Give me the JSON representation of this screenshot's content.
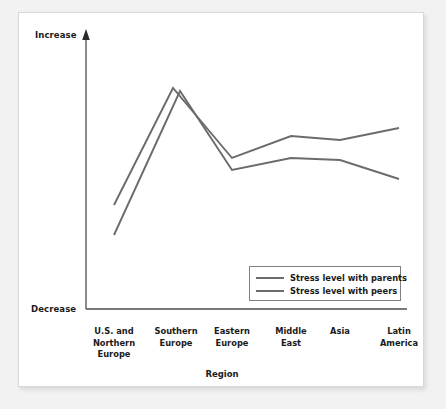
{
  "figure": {
    "background_color": "#f2f2f2",
    "card_color": "#ffffff",
    "line_color": "#6b6b6b",
    "axis_color": "#4d4d4d",
    "text_color": "#1a1a1a"
  },
  "chart_data": {
    "type": "line",
    "title": "",
    "xlabel": "Region",
    "ylabel": "",
    "grid": false,
    "legend_position": "inside-bottom-right",
    "y_axis_top_label": "Increase",
    "y_axis_bottom_label": "Decrease",
    "y_axis_ticks": [],
    "ylim": [
      0,
      100
    ],
    "categories": [
      "U.S. and Northern Europe",
      "Southern Europe",
      "Eastern Europe",
      "Middle East",
      "Asia",
      "Latin America"
    ],
    "category_lines": [
      [
        "U.S. and",
        "Northern",
        "Europe"
      ],
      [
        "Southern",
        "Europe"
      ],
      [
        "Eastern",
        "Europe"
      ],
      [
        "Middle",
        "East"
      ],
      [
        "Asia"
      ],
      [
        "Latin",
        "America"
      ]
    ],
    "series": [
      {
        "name": "Stress level with parents",
        "color": "#6b6b6b",
        "values": [
          33,
          96,
          65,
          73,
          71,
          78
        ]
      },
      {
        "name": "Stress level with peers",
        "color": "#6b6b6b",
        "values": [
          22,
          95,
          61,
          65,
          64,
          52
        ]
      }
    ]
  },
  "legend": {
    "items": [
      {
        "label": "Stress level with parents"
      },
      {
        "label": "Stress level with peers"
      }
    ]
  }
}
